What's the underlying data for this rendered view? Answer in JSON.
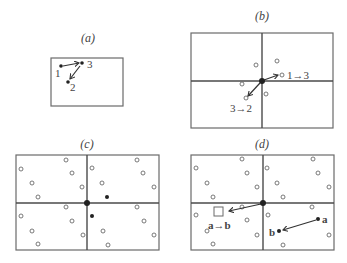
{
  "colors": {
    "frame": "#6a6a6a",
    "divider": "#4a4a4a",
    "point": "#222222",
    "text": "#444444"
  },
  "panels": [
    {
      "id": "a",
      "title": "(a)",
      "title_pos": [
        88,
        42
      ],
      "rect": [
        51,
        58,
        72,
        48
      ],
      "dividers": [],
      "hollow_points": [],
      "solid_points": [
        [
          61,
          66,
          1.8
        ],
        [
          82,
          63,
          1.8
        ],
        [
          68,
          82,
          1.8
        ]
      ],
      "arrows": [
        [
          63,
          66,
          79,
          63
        ],
        [
          80,
          66,
          70,
          79
        ]
      ],
      "labels": [
        {
          "text": "1",
          "x": 55,
          "y": 77,
          "style": "lbl"
        },
        {
          "text": "3",
          "x": 87,
          "y": 68,
          "style": "lbl"
        },
        {
          "text": "2",
          "x": 70,
          "y": 91,
          "style": "lbl"
        }
      ],
      "boxes": []
    },
    {
      "id": "b",
      "title": "(b)",
      "title_pos": [
        262,
        20
      ],
      "rect": [
        191,
        33,
        142,
        95
      ],
      "dividers": [
        [
          262,
          33,
          262,
          128
        ],
        [
          191,
          81,
          333,
          81
        ]
      ],
      "hollow_points": [
        [
          256,
          65
        ],
        [
          277,
          61
        ],
        [
          282,
          75
        ],
        [
          242,
          84
        ],
        [
          266,
          94
        ],
        [
          246,
          98
        ]
      ],
      "solid_points": [
        [
          262,
          81,
          3
        ]
      ],
      "arrows": [
        [
          264,
          80,
          278,
          75
        ],
        [
          260,
          83,
          248,
          96
        ]
      ],
      "labels": [
        {
          "text": "1→3",
          "x": 287,
          "y": 79,
          "style": "lbl"
        },
        {
          "text": "3→2",
          "x": 230,
          "y": 112,
          "style": "lbl"
        }
      ],
      "boxes": []
    },
    {
      "id": "c",
      "title": "(c)",
      "title_pos": [
        87,
        148
      ],
      "rect": [
        16,
        155,
        143,
        95
      ],
      "dividers": [
        [
          87,
          155,
          87,
          250
        ],
        [
          16,
          203,
          159,
          203
        ]
      ],
      "hollow_points": [
        [
          66,
          160
        ],
        [
          21,
          169
        ],
        [
          72,
          173
        ],
        [
          32,
          183
        ],
        [
          82,
          187
        ],
        [
          38,
          197
        ],
        [
          92,
          168
        ],
        [
          102,
          183
        ],
        [
          137,
          160
        ],
        [
          143,
          173
        ],
        [
          154,
          187
        ],
        [
          66,
          207
        ],
        [
          21,
          216
        ],
        [
          72,
          221
        ],
        [
          32,
          231
        ],
        [
          83,
          235
        ],
        [
          38,
          244
        ],
        [
          137,
          207
        ],
        [
          144,
          221
        ],
        [
          103,
          231
        ],
        [
          154,
          235
        ],
        [
          108,
          245
        ]
      ],
      "solid_points": [
        [
          87,
          203,
          3
        ],
        [
          107,
          197,
          2
        ],
        [
          92,
          216,
          2
        ]
      ],
      "arrows": [],
      "labels": [],
      "boxes": []
    },
    {
      "id": "d",
      "title": "(d)",
      "title_pos": [
        262,
        148
      ],
      "rect": [
        191,
        155,
        143,
        95
      ],
      "dividers": [
        [
          263,
          155,
          263,
          250
        ],
        [
          191,
          203,
          334,
          203
        ]
      ],
      "hollow_points": [
        [
          242,
          159
        ],
        [
          196,
          168
        ],
        [
          247,
          173
        ],
        [
          207,
          183
        ],
        [
          257,
          187
        ],
        [
          213,
          197
        ],
        [
          267,
          168
        ],
        [
          277,
          183
        ],
        [
          313,
          159
        ],
        [
          318,
          173
        ],
        [
          329,
          187
        ],
        [
          283,
          197
        ],
        [
          242,
          207
        ],
        [
          196,
          215
        ],
        [
          247,
          220
        ],
        [
          207,
          231
        ],
        [
          257,
          235
        ],
        [
          213,
          244
        ],
        [
          312,
          207
        ],
        [
          268,
          215
        ],
        [
          329,
          235
        ],
        [
          283,
          245
        ]
      ],
      "solid_points": [
        [
          263,
          203,
          3
        ],
        [
          318,
          219,
          2
        ],
        [
          279,
          231,
          2
        ]
      ],
      "arrows": [
        [
          261,
          204,
          229,
          211
        ],
        [
          316,
          220,
          283,
          230
        ]
      ],
      "labels": [
        {
          "text": "a→b",
          "x": 208,
          "y": 229,
          "style": "lblb"
        },
        {
          "text": "a",
          "x": 322,
          "y": 223,
          "style": "lblb"
        },
        {
          "text": "b",
          "x": 269,
          "y": 236,
          "style": "lblb"
        }
      ],
      "boxes": [
        [
          214,
          207,
          9,
          9
        ]
      ]
    }
  ]
}
